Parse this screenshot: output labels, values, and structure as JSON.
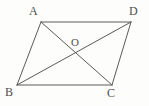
{
  "figure": {
    "kind": "geometry-diagram",
    "shape": "parallelogram-with-diagonals",
    "background_color": "#fdfdfc",
    "stroke_color": "#5a5a58",
    "label_color": "#4f4f4d",
    "stroke_width": 1,
    "width": 149,
    "height": 106,
    "points": {
      "A": {
        "label": "A",
        "x": 41,
        "y": 22,
        "label_x": 29,
        "label_y": 5
      },
      "D": {
        "label": "D",
        "x": 131,
        "y": 22,
        "label_x": 129,
        "label_y": 5
      },
      "B": {
        "label": "B",
        "x": 17,
        "y": 85,
        "label_x": 5,
        "label_y": 86
      },
      "C": {
        "label": "C",
        "x": 112,
        "y": 85,
        "label_x": 107,
        "label_y": 87
      },
      "O": {
        "label": "O",
        "x": 76,
        "y": 53,
        "label_x": 71,
        "label_y": 36
      }
    },
    "segments": [
      {
        "name": "AD",
        "from": "A",
        "to": "D",
        "role": "side",
        "x1": 41,
        "y1": 22,
        "x2": 131,
        "y2": 22
      },
      {
        "name": "DC",
        "from": "D",
        "to": "C",
        "role": "side",
        "x1": 131,
        "y1": 22,
        "x2": 112,
        "y2": 85
      },
      {
        "name": "CB",
        "from": "C",
        "to": "B",
        "role": "side",
        "x1": 112,
        "y1": 85,
        "x2": 17,
        "y2": 85
      },
      {
        "name": "BA",
        "from": "B",
        "to": "A",
        "role": "side",
        "x1": 17,
        "y1": 85,
        "x2": 41,
        "y2": 22
      },
      {
        "name": "AC",
        "from": "A",
        "to": "C",
        "role": "diagonal",
        "x1": 41,
        "y1": 22,
        "x2": 112,
        "y2": 85
      },
      {
        "name": "BD",
        "from": "B",
        "to": "D",
        "role": "diagonal",
        "x1": 17,
        "y1": 85,
        "x2": 131,
        "y2": 22
      }
    ]
  }
}
